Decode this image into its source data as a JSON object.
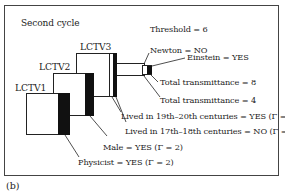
{
  "figure": {
    "title": "Second cycle",
    "threshold": "Threshold = 6",
    "sublabel": "(b)",
    "panels": [
      {
        "label": "LCTV1"
      },
      {
        "label": "LCTV2"
      },
      {
        "label": "LCTV3"
      }
    ],
    "annotations": {
      "newton": "Newton = NO",
      "einstein": "Einstein = YES",
      "total8": "Total transmittance = 8",
      "total4": "Total transmittance = 4",
      "lived1920": "Lived in 19th–20th centuries = YES (Γ = 2)",
      "lived1718": "Lived in 17th–18th centuries = NO (Γ = 1)",
      "male": "Male = YES (Γ = 2)",
      "physicist": "Physicist = YES (Γ = 2)"
    }
  }
}
